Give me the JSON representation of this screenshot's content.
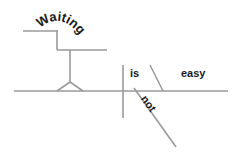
{
  "document": {
    "type": "sentence-diagram",
    "style": "reed-kellogg",
    "width": 238,
    "height": 155,
    "background_color": "#ffffff",
    "line_color": "#9a9a9a",
    "text_color": "#1a1a1a"
  },
  "clipped_header": {
    "text": "Waiting is not easy",
    "note": "row of text cropped off at the very top of the screenshot, only descender pixels visible"
  },
  "labels": {
    "subject_gerund": "Waiting",
    "verb": "is",
    "adverb": "not",
    "predicate_adjective": "easy"
  },
  "lines": {
    "baseline": {
      "x1": 14,
      "y1": 91,
      "x2": 228,
      "y2": 91
    },
    "subject_predicate_divider": {
      "x1": 123,
      "y1": 65,
      "x2": 123,
      "y2": 118
    },
    "predicate_adjective_slant": {
      "x1": 150,
      "y1": 65,
      "x2": 163,
      "y2": 91
    },
    "adverb_slant": {
      "x1": 134,
      "y1": 88,
      "x2": 176,
      "y2": 147
    },
    "gerund_step_top": {
      "x1": 23,
      "y1": 31,
      "x2": 57,
      "y2": 31
    },
    "gerund_step_drop": {
      "x1": 57,
      "y1": 31,
      "x2": 57,
      "y2": 50
    },
    "gerund_step_bottom": {
      "x1": 57,
      "y1": 50,
      "x2": 107,
      "y2": 50
    },
    "gerund_stem": {
      "x1": 70,
      "y1": 50,
      "x2": 70,
      "y2": 82
    },
    "gerund_tripod_left": {
      "x1": 70,
      "y1": 82,
      "x2": 58,
      "y2": 91
    },
    "gerund_tripod_right": {
      "x1": 70,
      "y1": 82,
      "x2": 82,
      "y2": 91
    }
  },
  "curved_text": {
    "waiting_path": "M 40 28 Q 62 10 82 38",
    "not_path": "M 140 97 L 172 142"
  }
}
